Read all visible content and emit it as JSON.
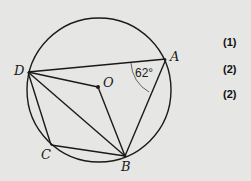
{
  "diagram": {
    "circle": {
      "cx": 99,
      "cy": 90,
      "r": 72
    },
    "points": {
      "A": {
        "label": "A",
        "x": 166,
        "y": 59
      },
      "B": {
        "label": "B",
        "x": 125,
        "y": 156
      },
      "C": {
        "label": "C",
        "x": 51,
        "y": 145
      },
      "D": {
        "label": "D",
        "x": 28,
        "y": 72
      },
      "O": {
        "label": "O",
        "x": 98,
        "y": 87
      }
    },
    "segments": [
      "DA",
      "AB",
      "DO",
      "OB",
      "DB",
      "DC",
      "CB"
    ],
    "angle": {
      "vertex": "A",
      "between": [
        "D",
        "B"
      ],
      "label": "62°"
    },
    "stroke_color": "#1a1a1a",
    "background_color": "#e6e6e4"
  },
  "marks": [
    {
      "label": "(1)"
    },
    {
      "label": "(2)"
    },
    {
      "label": "(2)"
    }
  ]
}
